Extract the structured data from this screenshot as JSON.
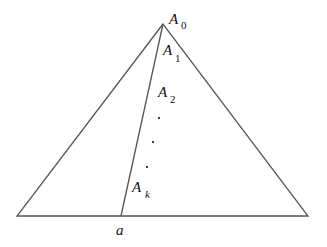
{
  "diagram": {
    "type": "geometry",
    "colors": {
      "stroke": "#555555",
      "text": "#111111",
      "background": "#ffffff"
    },
    "labels": {
      "a0": {
        "letter": "A",
        "sub": "0"
      },
      "a1": {
        "letter": "A",
        "sub": "1"
      },
      "a2": {
        "letter": "A",
        "sub": "2"
      },
      "ak": {
        "letter": "A",
        "sub": "k"
      },
      "base_point": "a"
    },
    "ellipsis_dots": 3
  }
}
